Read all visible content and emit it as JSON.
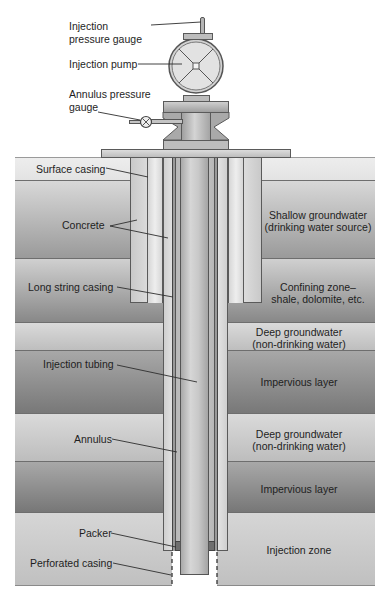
{
  "figure": {
    "type": "cross-section diagram"
  },
  "equipment_labels": {
    "injection_pressure_gauge": "Injection pressure gauge",
    "injection_pump": "Injection pump",
    "annulus_pressure_gauge": "Annulus pressure gauge"
  },
  "well_labels": {
    "surface_casing": "Surface casing",
    "concrete": "Concrete",
    "long_string_casing": "Long string casing",
    "injection_tubing": "Injection tubing",
    "annulus": "Annulus",
    "packer": "Packer",
    "perforated_casing": "Perforated casing"
  },
  "layers": [
    {
      "id": "surface",
      "label": "",
      "color_top": "#ececec",
      "color_bottom": "#e2e2e2"
    },
    {
      "id": "shallow_groundwater",
      "label_line1": "Shallow groundwater",
      "label_line2": "(drinking water source)",
      "color_top": "#d6d6d6",
      "color_bottom": "#9c9c9c"
    },
    {
      "id": "confining_zone",
      "label_line1": "Confining zone–",
      "label_line2": "shale, dolomite, etc.",
      "color_top": "#cfcfcf",
      "color_bottom": "#8a8a8a"
    },
    {
      "id": "deep_groundwater_1",
      "label_line1": "Deep groundwater",
      "label_line2": "(non-drinking water)",
      "color_top": "#d9d9d9",
      "color_bottom": "#bdbdbd"
    },
    {
      "id": "impervious_1",
      "label": "Impervious layer",
      "color_top": "#a5a5a5",
      "color_bottom": "#7a7a7a"
    },
    {
      "id": "deep_groundwater_2",
      "label_line1": "Deep groundwater",
      "label_line2": "(non-drinking water)",
      "color_top": "#d9d9d9",
      "color_bottom": "#bdbdbd"
    },
    {
      "id": "impervious_2",
      "label": "Impervious layer",
      "color_top": "#a5a5a5",
      "color_bottom": "#7a7a7a"
    },
    {
      "id": "injection_zone",
      "label": "Injection zone",
      "color_top": "#d4d4d4",
      "color_bottom": "#c2c2c2"
    }
  ],
  "colors": {
    "pipe_light": "#e0e0e0",
    "pipe_mid": "#c6c6c6",
    "pipe_dark": "#8f8f8f",
    "outline": "#5a5a5a",
    "leader_line": "#333333"
  }
}
